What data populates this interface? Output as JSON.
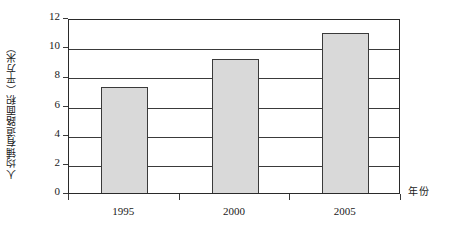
{
  "chart_data": {
    "type": "bar",
    "title": "",
    "subtitle": "",
    "categories": [
      "1995",
      "2000",
      "2005"
    ],
    "values": [
      7.3,
      9.2,
      11.0
    ],
    "series": [
      {
        "name": "人均铺有道路面积",
        "values": [
          7.3,
          9.2,
          11.0
        ]
      }
    ],
    "xlabel": "年份",
    "ylabel": "人均铺有道路面积（平方米）",
    "ylim": [
      0,
      12
    ],
    "yticks": [
      "0",
      "2",
      "4",
      "6",
      "8",
      "10",
      "12"
    ],
    "ytick_values": [
      0,
      2,
      4,
      6,
      8,
      10,
      12
    ],
    "xticks": [
      "1995",
      "2000",
      "2005"
    ],
    "grid": "horizontal",
    "legend": "none",
    "bar_fill_color": "#d9d9d9",
    "bar_border_color": "#3a3a3a",
    "axis_color": "#2a2a2a",
    "background_color": "#ffffff"
  },
  "axes": {
    "y": {
      "title": "人均铺有道路面积（平方米）",
      "ticks": [
        {
          "label": "12",
          "value": 12
        },
        {
          "label": "10",
          "value": 10
        },
        {
          "label": "8",
          "value": 8
        },
        {
          "label": "6",
          "value": 6
        },
        {
          "label": "4",
          "value": 4
        },
        {
          "label": "2",
          "value": 2
        },
        {
          "label": "0",
          "value": 0
        }
      ]
    },
    "x": {
      "title": "年份",
      "ticks": [
        {
          "label": "1995",
          "value": 7.3
        },
        {
          "label": "2000",
          "value": 9.2
        },
        {
          "label": "2005",
          "value": 11.0
        }
      ]
    }
  }
}
